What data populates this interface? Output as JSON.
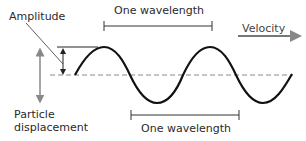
{
  "diagram": {
    "labels": {
      "amplitude": "Amplitude",
      "wavelength_top": "One wavelength",
      "wavelength_bottom": "One wavelength",
      "velocity": "Velocity",
      "particle_displacement_line1": "Particle",
      "particle_displacement_line2": "displacement"
    },
    "colors": {
      "wave": "#111111",
      "axis_dashed": "#888888",
      "velocity_arrow": "#777777",
      "displacement_arrow": "#888888",
      "annotation": "#222222",
      "text": "#2a2a2a"
    },
    "wave": {
      "axis_y": 75,
      "amplitude_px": 28,
      "wavelength_px": 106,
      "start_x": 75,
      "end_x": 292
    }
  }
}
